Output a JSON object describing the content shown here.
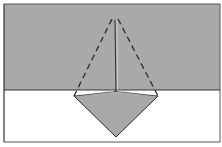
{
  "diagram": {
    "type": "origami-fold-step",
    "colors": {
      "paper_gray": "#a9a9a9",
      "background": "#ffffff",
      "line": "#2a2a2a"
    },
    "frame": {
      "x": 4,
      "y": 4,
      "width": 216,
      "height": 138
    },
    "gray_band": {
      "x": 4,
      "y": 4,
      "width": 216,
      "height": 86
    },
    "divider_y": 90,
    "apex": {
      "x": 115,
      "y": 18
    },
    "dashed_left_end": {
      "x": 74,
      "y": 96
    },
    "dashed_right_end": {
      "x": 158,
      "y": 96
    },
    "center_line": {
      "x1": 115,
      "y1": 20,
      "x2": 116,
      "y2": 91
    },
    "kite": {
      "left": {
        "x": 74,
        "y": 96
      },
      "center": {
        "x": 116,
        "y": 91
      },
      "right": {
        "x": 158,
        "y": 96
      },
      "bottom": {
        "x": 116,
        "y": 137
      }
    }
  }
}
